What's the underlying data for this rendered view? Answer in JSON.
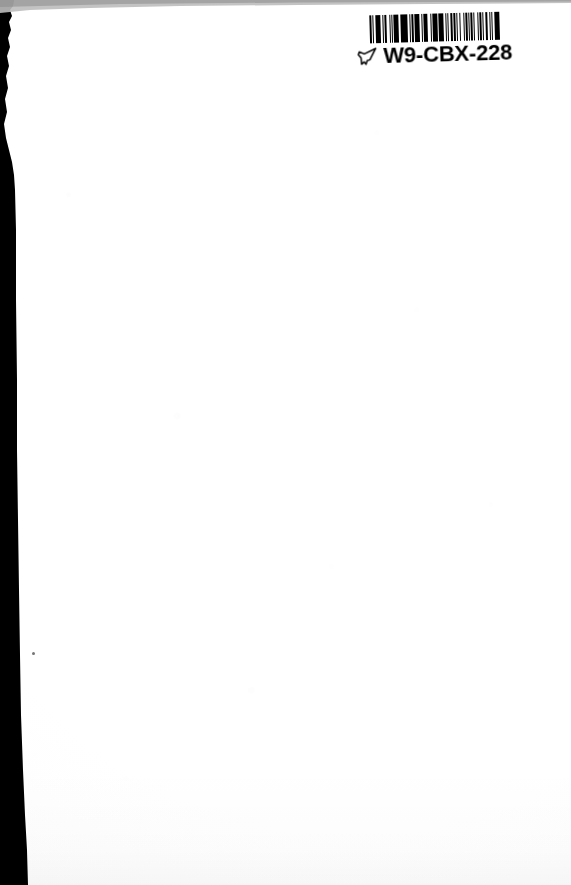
{
  "document": {
    "kind": "scanned-page",
    "page_type": "blank back cover / flyleaf",
    "width_px": 571,
    "height_px": 885,
    "background_color": "#ffffff",
    "paper_color": "#fdfdfd",
    "ink_color": "#000000",
    "gutter_color": "#000000",
    "body_text": ""
  },
  "label": {
    "name": "library barcode label",
    "code": "W9-CBX-228",
    "pointer_icon": "pointing-hand-icon",
    "barcode": {
      "symbology": "linear 1D barcode",
      "bar_color": "#000000",
      "background_color": "#ffffff",
      "module_widths": [
        3,
        2,
        1,
        2,
        3,
        1,
        4,
        2,
        1,
        3,
        2,
        4,
        1,
        2,
        1,
        3,
        2,
        1,
        4,
        2,
        3,
        1,
        2,
        1,
        3,
        4,
        1,
        2,
        2,
        1,
        3,
        1,
        4,
        2,
        1,
        3,
        2,
        1,
        2,
        4,
        1,
        3,
        2,
        1,
        3,
        2,
        4,
        1,
        2,
        3,
        1,
        2,
        1,
        4,
        2,
        1,
        3,
        2,
        1,
        3,
        2,
        4,
        1,
        2,
        3,
        1,
        2,
        1,
        3,
        2,
        1,
        4,
        2,
        1,
        3,
        2,
        1,
        2,
        3,
        4,
        1,
        2,
        1,
        3,
        2,
        1,
        4,
        3
      ]
    }
  },
  "artifacts": {
    "left_gutter_label": "scanner-gutter",
    "top_edge_label": "torn-paper-edge",
    "speck_label": "dust-speck"
  }
}
